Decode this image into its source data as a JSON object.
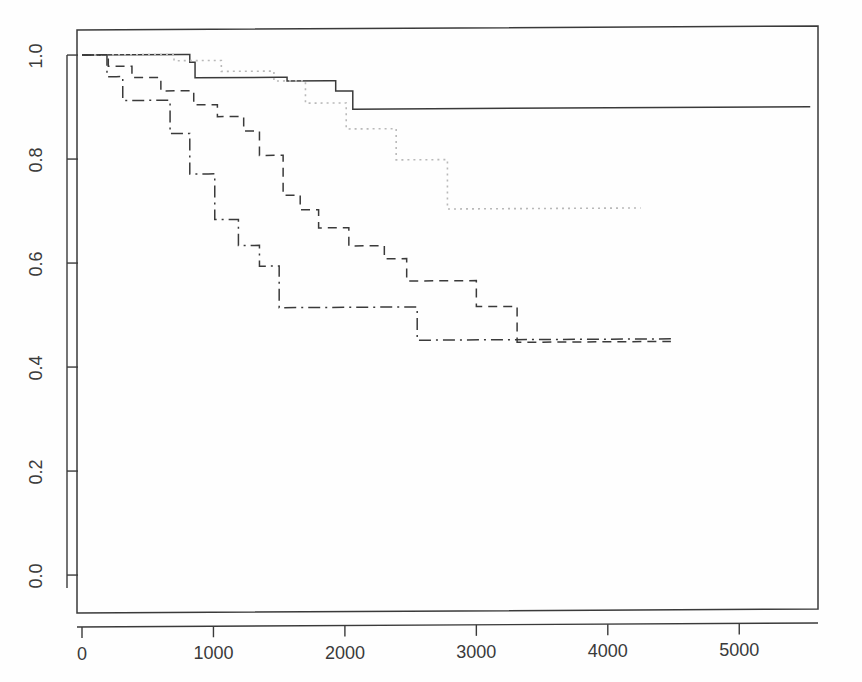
{
  "figure": {
    "kind": "kaplan-meier-survival-plot",
    "background": "#fefefe",
    "ink_color": "#3a3a3a",
    "dotted_color": "#b9b9b9",
    "title": "",
    "subtitle": ""
  },
  "chart_data": {
    "type": "line",
    "title": "",
    "xlabel": "",
    "ylabel": "",
    "xlim": [
      0,
      5700
    ],
    "ylim": [
      -0.06,
      1.06
    ],
    "xticks": [
      0,
      1000,
      2000,
      3000,
      4000,
      5000
    ],
    "xtick_labels": [
      "0",
      "1000",
      "2000",
      "3000",
      "4000",
      "5000"
    ],
    "yticks": [
      0.0,
      0.2,
      0.4,
      0.6,
      0.8,
      1.0
    ],
    "ytick_labels": [
      "0.0",
      "0.2",
      "0.4",
      "0.6",
      "0.8",
      "1.0"
    ],
    "grid": false,
    "legend": "none",
    "box": true,
    "step_shape": "hv",
    "series": [
      {
        "name": "group-1",
        "linestyle": "solid",
        "color": "#3a3a3a",
        "x": [
          0,
          790,
          820,
          860,
          1500,
          1560,
          1880,
          1930,
          2020,
          2060,
          5540
        ],
        "y": [
          1.0,
          1.0,
          0.985,
          0.955,
          0.955,
          0.948,
          0.948,
          0.928,
          0.928,
          0.893,
          0.893
        ]
      },
      {
        "name": "group-2",
        "linestyle": "dotted",
        "color": "#b9b9b9",
        "x": [
          0,
          660,
          700,
          1000,
          1060,
          1410,
          1460,
          1650,
          1700,
          1960,
          2010,
          2330,
          2390,
          2720,
          2780,
          4250
        ],
        "y": [
          1.0,
          1.0,
          0.988,
          0.988,
          0.967,
          0.967,
          0.948,
          0.948,
          0.905,
          0.905,
          0.855,
          0.855,
          0.795,
          0.795,
          0.7,
          0.7
        ]
      },
      {
        "name": "group-3",
        "linestyle": "dashed",
        "color": "#3a3a3a",
        "x": [
          0,
          150,
          200,
          330,
          380,
          560,
          600,
          800,
          850,
          980,
          1030,
          1180,
          1230,
          1300,
          1350,
          1480,
          1530,
          1620,
          1660,
          1760,
          1800,
          1980,
          2030,
          2250,
          2300,
          2420,
          2470,
          2940,
          3000,
          3260,
          3310,
          4480
        ],
        "y": [
          1.0,
          1.0,
          0.978,
          0.978,
          0.956,
          0.956,
          0.93,
          0.93,
          0.903,
          0.903,
          0.88,
          0.88,
          0.852,
          0.852,
          0.805,
          0.805,
          0.728,
          0.728,
          0.7,
          0.7,
          0.665,
          0.665,
          0.63,
          0.63,
          0.605,
          0.605,
          0.562,
          0.562,
          0.512,
          0.512,
          0.443,
          0.443
        ]
      },
      {
        "name": "group-4",
        "linestyle": "dashdot",
        "color": "#3a3a3a",
        "x": [
          0,
          140,
          190,
          260,
          310,
          620,
          670,
          760,
          820,
          960,
          1010,
          1140,
          1190,
          1300,
          1350,
          1450,
          1500,
          2440,
          2500,
          2550,
          4480
        ],
        "y": [
          1.0,
          1.0,
          0.958,
          0.958,
          0.912,
          0.912,
          0.848,
          0.848,
          0.77,
          0.77,
          0.682,
          0.682,
          0.632,
          0.632,
          0.592,
          0.592,
          0.512,
          0.512,
          0.512,
          0.448,
          0.448
        ]
      }
    ]
  },
  "axes": {
    "x_axis_name": "time-axis",
    "y_axis_name": "survival-probability-axis"
  }
}
